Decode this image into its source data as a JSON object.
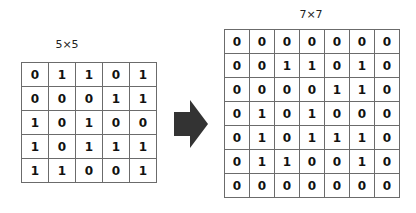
{
  "left": {
    "label": "5×5",
    "rows": [
      [
        "0",
        "1",
        "1",
        "0",
        "1"
      ],
      [
        "0",
        "0",
        "0",
        "1",
        "1"
      ],
      [
        "1",
        "0",
        "1",
        "0",
        "0"
      ],
      [
        "1",
        "0",
        "1",
        "1",
        "1"
      ],
      [
        "1",
        "1",
        "0",
        "0",
        "1"
      ]
    ]
  },
  "right": {
    "label": "7×7",
    "rows": [
      [
        "0",
        "0",
        "0",
        "0",
        "0",
        "0",
        "0"
      ],
      [
        "0",
        "0",
        "1",
        "1",
        "0",
        "1",
        "0"
      ],
      [
        "0",
        "0",
        "0",
        "0",
        "1",
        "1",
        "0"
      ],
      [
        "0",
        "1",
        "0",
        "1",
        "0",
        "0",
        "0"
      ],
      [
        "0",
        "1",
        "0",
        "1",
        "1",
        "1",
        "0"
      ],
      [
        "0",
        "1",
        "1",
        "0",
        "0",
        "1",
        "0"
      ],
      [
        "0",
        "0",
        "0",
        "0",
        "0",
        "0",
        "0"
      ]
    ]
  },
  "arrow": {
    "icon": "right-arrow-icon",
    "color": "#333333"
  }
}
